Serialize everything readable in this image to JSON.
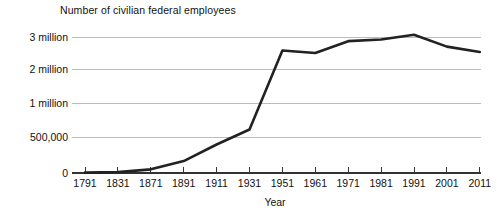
{
  "chart_data": {
    "type": "line",
    "title": "Number of civilian federal employees",
    "xlabel": "Year",
    "ylabel": "",
    "grid": true,
    "legend": false,
    "categories": [
      "1791",
      "1831",
      "1871",
      "1891",
      "1911",
      "1931",
      "1951",
      "1961",
      "1971",
      "1981",
      "1991",
      "2001",
      "2011"
    ],
    "values": [
      5000,
      12000,
      51000,
      166000,
      396000,
      610000,
      2580000,
      2500000,
      2870000,
      2920000,
      3070000,
      2700000,
      2530000
    ],
    "ytick_labels": [
      "0",
      "500,000",
      "1 million",
      "2 million",
      "3 million"
    ],
    "ytick_values": [
      0,
      500000,
      1000000,
      2000000,
      3000000
    ],
    "ylim": [
      0,
      3200000
    ],
    "y_axis_scale": "non-linear-piecewise",
    "series": [
      {
        "name": "Number of civilian federal employees",
        "values": [
          5000,
          12000,
          51000,
          166000,
          396000,
          610000,
          2580000,
          2500000,
          2870000,
          2920000,
          3070000,
          2700000,
          2530000
        ]
      }
    ],
    "line_color": "#222222",
    "gridline_color": "#b5b5b5",
    "axis_color": "#333333",
    "background_color": "#ffffff"
  },
  "axes": {
    "x_axis_title": "Year",
    "y_axis_title": ""
  }
}
